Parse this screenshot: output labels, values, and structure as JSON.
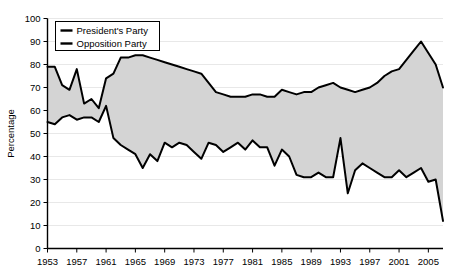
{
  "chart_data": {
    "type": "line",
    "title": "",
    "xlabel": "",
    "ylabel": "Percentage",
    "ylim": [
      0,
      100
    ],
    "xlim": [
      1953,
      2007
    ],
    "ytick_step": 10,
    "xtick_step": 4,
    "grid": true,
    "fill_between": true,
    "fill_color": "#d4d4d4",
    "line_color": "#000000",
    "legend_position": "top-left",
    "yticks": [
      0,
      10,
      20,
      30,
      40,
      50,
      60,
      70,
      80,
      90,
      100
    ],
    "xticks": [
      1953,
      1957,
      1961,
      1965,
      1969,
      1973,
      1977,
      1981,
      1985,
      1989,
      1993,
      1997,
      2001,
      2005
    ],
    "x": [
      1953,
      1954,
      1955,
      1956,
      1957,
      1958,
      1959,
      1960,
      1961,
      1962,
      1963,
      1964,
      1965,
      1966,
      1967,
      1968,
      1969,
      1970,
      1971,
      1972,
      1973,
      1974,
      1975,
      1976,
      1977,
      1978,
      1979,
      1980,
      1981,
      1982,
      1983,
      1984,
      1985,
      1986,
      1987,
      1988,
      1989,
      1990,
      1991,
      1992,
      1993,
      1994,
      1995,
      1996,
      1997,
      1998,
      1999,
      2000,
      2001,
      2002,
      2003,
      2004,
      2005,
      2006,
      2007
    ],
    "series": [
      {
        "name": "President's Party",
        "values": [
          79,
          79,
          71,
          69,
          78,
          63,
          65,
          61,
          74,
          76,
          83,
          83,
          84,
          84,
          83,
          82,
          81,
          80,
          79,
          78,
          77,
          76,
          72,
          68,
          67,
          66,
          66,
          66,
          67,
          67,
          66,
          66,
          69,
          68,
          67,
          68,
          68,
          70,
          71,
          72,
          70,
          69,
          68,
          69,
          70,
          72,
          75,
          77,
          78,
          82,
          86,
          90,
          85,
          80,
          70
        ]
      },
      {
        "name": "Opposition Party",
        "values": [
          55,
          54,
          57,
          58,
          56,
          57,
          57,
          55,
          62,
          48,
          45,
          43,
          41,
          35,
          41,
          38,
          46,
          44,
          46,
          45,
          42,
          39,
          46,
          45,
          42,
          44,
          46,
          43,
          47,
          44,
          44,
          36,
          43,
          40,
          32,
          31,
          31,
          33,
          31,
          31,
          48,
          24,
          34,
          37,
          35,
          33,
          31,
          31,
          34,
          31,
          33,
          35,
          29,
          30,
          12
        ]
      }
    ],
    "legend": [
      {
        "label": "President's Party"
      },
      {
        "label": "Opposition Party"
      }
    ]
  },
  "ylabel": "Percentage"
}
